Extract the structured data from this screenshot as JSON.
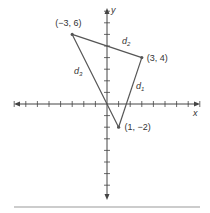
{
  "axes": {
    "x_label": "x",
    "y_label": "y",
    "origin_px": [
      107,
      104
    ],
    "unit_px": 11.6,
    "x_ticks": [
      -8,
      -7,
      -6,
      -5,
      -4,
      -3,
      -2,
      -1,
      1,
      2,
      3,
      4,
      5,
      6,
      7,
      8
    ],
    "y_ticks": [
      -7,
      -6,
      -5,
      -4,
      -3,
      -2,
      -1,
      1,
      2,
      3,
      4,
      5,
      6,
      7,
      8
    ]
  },
  "points": [
    {
      "id": "A",
      "x": -3,
      "y": 6,
      "label": "(−3, 6)"
    },
    {
      "id": "B",
      "x": 3,
      "y": 4,
      "label": "(3, 4)"
    },
    {
      "id": "C",
      "x": 1,
      "y": -2,
      "label": "(1, −2)"
    }
  ],
  "segments": [
    {
      "from": "B",
      "to": "C",
      "label": "d",
      "sub": "1"
    },
    {
      "from": "A",
      "to": "B",
      "label": "d",
      "sub": "2"
    },
    {
      "from": "A",
      "to": "C",
      "label": "d",
      "sub": "3"
    }
  ],
  "colors": {
    "line": "#555555",
    "axis": "#444444",
    "bottom_rule": "#bbbbbb"
  }
}
